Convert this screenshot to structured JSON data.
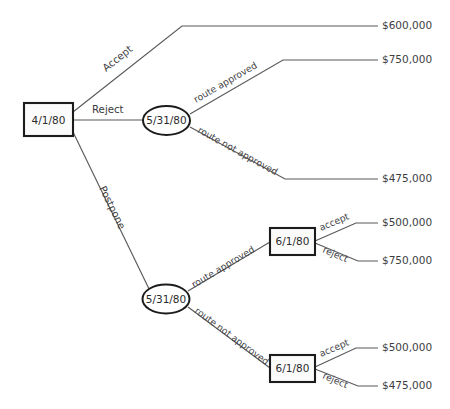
{
  "diagram": {
    "type": "decision-tree",
    "colors": {
      "background": "#ffffff",
      "edge": "#59595b",
      "node_border": "#1c1c1c",
      "node_fill": "#fbfbfb",
      "text": "#3d3d3f"
    }
  },
  "nodes": {
    "root": {
      "label": "4/1/80",
      "shape": "rect"
    },
    "chance_upper": {
      "label": "5/31/80",
      "shape": "ellipse"
    },
    "chance_lower": {
      "label": "5/31/80",
      "shape": "ellipse"
    },
    "decision_upper": {
      "label": "6/1/80",
      "shape": "rect"
    },
    "decision_lower": {
      "label": "6/1/80",
      "shape": "rect"
    }
  },
  "edge_labels": {
    "accept_root": "Accept",
    "reject_root": "Reject",
    "postpone_root": "Postpone",
    "upper_route_approved": "route approved",
    "upper_route_not_approved": "route not approved",
    "lower_route_approved": "route approved",
    "lower_route_not_approved": "route not approved",
    "upper_accept": "accept",
    "upper_reject": "reject",
    "lower_accept": "accept",
    "lower_reject": "reject"
  },
  "payoffs": {
    "accept": "$600,000",
    "reject_route_approved": "$750,000",
    "reject_route_not_approved": "$475,000",
    "postpone_approved_accept": "$500,000",
    "postpone_approved_reject": "$750,000",
    "postpone_not_approved_accept": "$500,000",
    "postpone_not_approved_reject": "$475,000"
  }
}
